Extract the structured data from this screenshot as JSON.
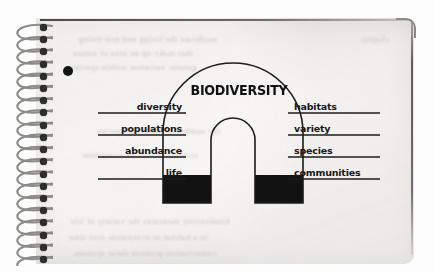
{
  "figure": {
    "kind": "notebook-page-diagram",
    "title": "BIODIVERSITY",
    "paper_color": "#eceae7",
    "ink_color": "#18181a"
  },
  "binding": {
    "type": "spiral-wire",
    "coil_count": 20,
    "hole_count": 20
  },
  "punch_dot": {
    "name": "hole-punch-mark",
    "x": 68,
    "y": 71,
    "radius": 5,
    "color": "#141414"
  },
  "arch": {
    "outer_left": 163,
    "outer_right": 303,
    "inner_left": 211,
    "inner_right": 255,
    "top": 63,
    "base": 203,
    "stroke_color": "#1c1c1c",
    "stroke_width": 1.6,
    "fill": "none",
    "leg_fill_color": "#121212",
    "leg_fill_top": 175
  },
  "labels": {
    "left": [
      {
        "text": "diversity",
        "underline_x1": 98,
        "underline_x2": 186,
        "underline_y": 113
      },
      {
        "text": "populations",
        "underline_x1": 98,
        "underline_x2": 186,
        "underline_y": 135
      },
      {
        "text": "abundance",
        "underline_x1": 98,
        "underline_x2": 186,
        "underline_y": 157
      },
      {
        "text": "life",
        "underline_x1": 98,
        "underline_x2": 186,
        "underline_y": 179
      }
    ],
    "right": [
      {
        "text": "habitats",
        "underline_x1": 288,
        "underline_x2": 380,
        "underline_y": 113
      },
      {
        "text": "variety",
        "underline_x1": 288,
        "underline_x2": 380,
        "underline_y": 135
      },
      {
        "text": "species",
        "underline_x1": 288,
        "underline_x2": 380,
        "underline_y": 157
      },
      {
        "text": "communities",
        "underline_x1": 288,
        "underline_x2": 380,
        "underline_y": 179
      }
    ]
  },
  "bleed_through": {
    "note": "faint illegible mirrored text showing through the page",
    "lines": [
      {
        "x": 78,
        "y": 34,
        "text": "moderate the living and non-living"
      },
      {
        "x": 72,
        "y": 48,
        "text": "that make up an area of nature"
      },
      {
        "x": 70,
        "y": 62,
        "text": "genetic variation within species"
      },
      {
        "x": 360,
        "y": 34,
        "text": "chapter"
      },
      {
        "x": 96,
        "y": 126,
        "text": "the number of different species"
      },
      {
        "x": 82,
        "y": 150,
        "text": "richness across an ecosystem"
      },
      {
        "x": 70,
        "y": 216,
        "text": "biodiversity measures the variety of life"
      },
      {
        "x": 68,
        "y": 232,
        "text": "in a habitat or ecosystem over time"
      },
      {
        "x": 74,
        "y": 248,
        "text": "conservation protects these systems"
      }
    ]
  }
}
